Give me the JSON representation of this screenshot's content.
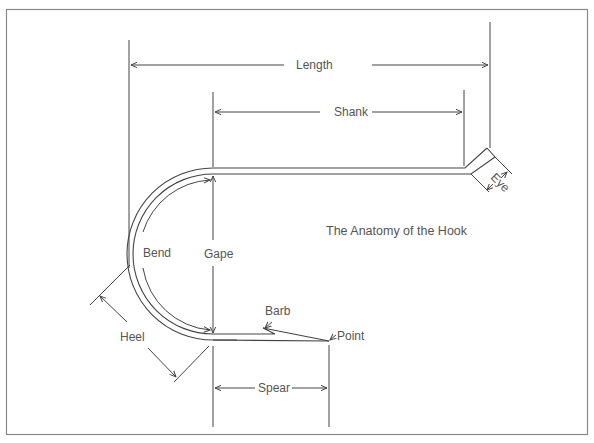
{
  "title": "The Anatomy of the Hook",
  "colors": {
    "background": "#ffffff",
    "line": "#444444",
    "border": "#888888",
    "text": "#555555"
  },
  "labels": {
    "length": "Length",
    "shank": "Shank",
    "eye": "Eye",
    "bend": "Bend",
    "gape": "Gape",
    "barb": "Barb",
    "point": "Point",
    "heel": "Heel",
    "spear": "Spear"
  }
}
